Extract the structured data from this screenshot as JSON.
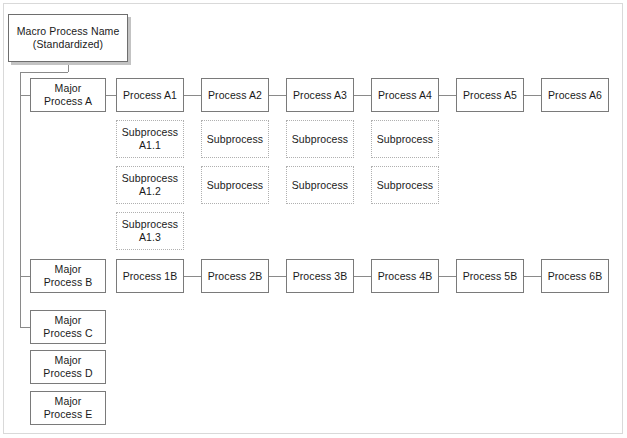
{
  "diagram": {
    "colors": {
      "box_border": "#7a7a7a",
      "dotted_border": "#b0b0b0",
      "connector": "#8a8a8a",
      "shadow": "#c3c3c3",
      "background": "#ffffff",
      "text": "#1a1a1a"
    },
    "macro": {
      "label": "Macro Process Name\n(Standardized)",
      "x": 8,
      "y": 14,
      "w": 120,
      "h": 48
    },
    "major_processes": [
      {
        "label": "Major\nProcess A",
        "x": 30,
        "y": 78,
        "w": 76,
        "h": 34,
        "connected": true
      },
      {
        "label": "Major\nProcess B",
        "x": 30,
        "y": 259,
        "w": 76,
        "h": 34,
        "connected": true
      },
      {
        "label": "Major\nProcess C",
        "x": 30,
        "y": 310,
        "w": 76,
        "h": 34,
        "connected": true
      },
      {
        "label": "Major\nProcess D",
        "x": 30,
        "y": 350,
        "w": 76,
        "h": 34,
        "connected": false
      },
      {
        "label": "Major\nProcess E",
        "x": 30,
        "y": 391,
        "w": 76,
        "h": 34,
        "connected": false
      }
    ],
    "row_a": {
      "y": 78,
      "h": 34,
      "w": 68,
      "processes": [
        {
          "label": "Process A1",
          "x": 116
        },
        {
          "label": "Process A2",
          "x": 201
        },
        {
          "label": "Process A3",
          "x": 286
        },
        {
          "label": "Process A4",
          "x": 371
        },
        {
          "label": "Process A5",
          "x": 456
        },
        {
          "label": "Process A6",
          "x": 541
        }
      ]
    },
    "subprocess_rows": {
      "w": 68,
      "h": 38,
      "ys": [
        120,
        166,
        212
      ],
      "columns": [
        {
          "x": 116,
          "items": [
            "Subprocess\nA1.1",
            "Subprocess\nA1.2",
            "Subprocess\nA1.3"
          ]
        },
        {
          "x": 201,
          "items": [
            "Subprocess",
            "Subprocess"
          ]
        },
        {
          "x": 286,
          "items": [
            "Subprocess",
            "Subprocess"
          ]
        },
        {
          "x": 371,
          "items": [
            "Subprocess",
            "Subprocess"
          ]
        }
      ]
    },
    "row_b": {
      "y": 259,
      "h": 34,
      "w": 68,
      "processes": [
        {
          "label": "Process 1B",
          "x": 116
        },
        {
          "label": "Process 2B",
          "x": 201
        },
        {
          "label": "Process 3B",
          "x": 286
        },
        {
          "label": "Process 4B",
          "x": 371
        },
        {
          "label": "Process 5B",
          "x": 456
        },
        {
          "label": "Process 6B",
          "x": 541
        }
      ]
    },
    "connectors": {
      "trunk": {
        "x": 20,
        "y_top": 72,
        "y_bottom": 327
      },
      "macro_stem": {
        "x": 68,
        "y_top": 62,
        "y_bottom": 72
      },
      "macro_elbow": {
        "x_from": 20,
        "x_to": 68,
        "y": 72
      },
      "stubs": [
        {
          "x_from": 20,
          "x_to": 30,
          "y": 95
        },
        {
          "x_from": 20,
          "x_to": 30,
          "y": 276
        },
        {
          "x_from": 20,
          "x_to": 30,
          "y": 327
        }
      ],
      "row_a_links": [
        {
          "x_from": 106,
          "x_to": 116,
          "y": 95
        },
        {
          "x_from": 184,
          "x_to": 201,
          "y": 95
        },
        {
          "x_from": 269,
          "x_to": 286,
          "y": 95
        },
        {
          "x_from": 354,
          "x_to": 371,
          "y": 95
        },
        {
          "x_from": 439,
          "x_to": 456,
          "y": 95
        },
        {
          "x_from": 524,
          "x_to": 541,
          "y": 95
        }
      ],
      "row_b_links": [
        {
          "x_from": 184,
          "x_to": 201,
          "y": 276
        },
        {
          "x_from": 269,
          "x_to": 286,
          "y": 276
        },
        {
          "x_from": 354,
          "x_to": 371,
          "y": 276
        },
        {
          "x_from": 439,
          "x_to": 456,
          "y": 276
        },
        {
          "x_from": 524,
          "x_to": 541,
          "y": 276
        }
      ]
    }
  }
}
